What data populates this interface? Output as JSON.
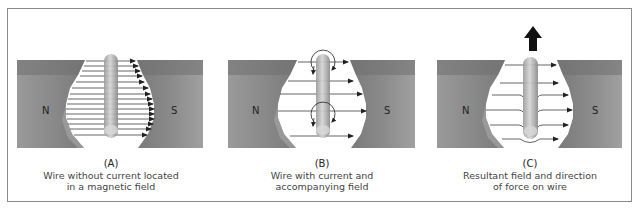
{
  "figure": {
    "panels": [
      {
        "id": "A",
        "letter": "(A)",
        "caption_line1": "Wire without current located",
        "caption_line2": "in a magnetic field",
        "north_label": "N",
        "south_label": "S",
        "field_lines": 15,
        "force_arrow": false
      },
      {
        "id": "B",
        "letter": "(B)",
        "caption_line1": "Wire with current and",
        "caption_line2": "accompanying field",
        "north_label": "N",
        "south_label": "S",
        "field_lines": 5,
        "circular_field_loops": 2,
        "force_arrow": false
      },
      {
        "id": "C",
        "letter": "(C)",
        "caption_line1": "Resultant field and direction",
        "caption_line2": "of force on wire",
        "north_label": "N",
        "south_label": "S",
        "field_lines": 6,
        "force_arrow": true,
        "force_direction": "up"
      }
    ],
    "colors": {
      "magnet": "#8c8c8c",
      "magnet_top": "#6f6f6f",
      "wire": "#b5b5b5",
      "field_line": "#222222",
      "force_arrow": "#111111",
      "border": "#8a8a8a"
    }
  }
}
